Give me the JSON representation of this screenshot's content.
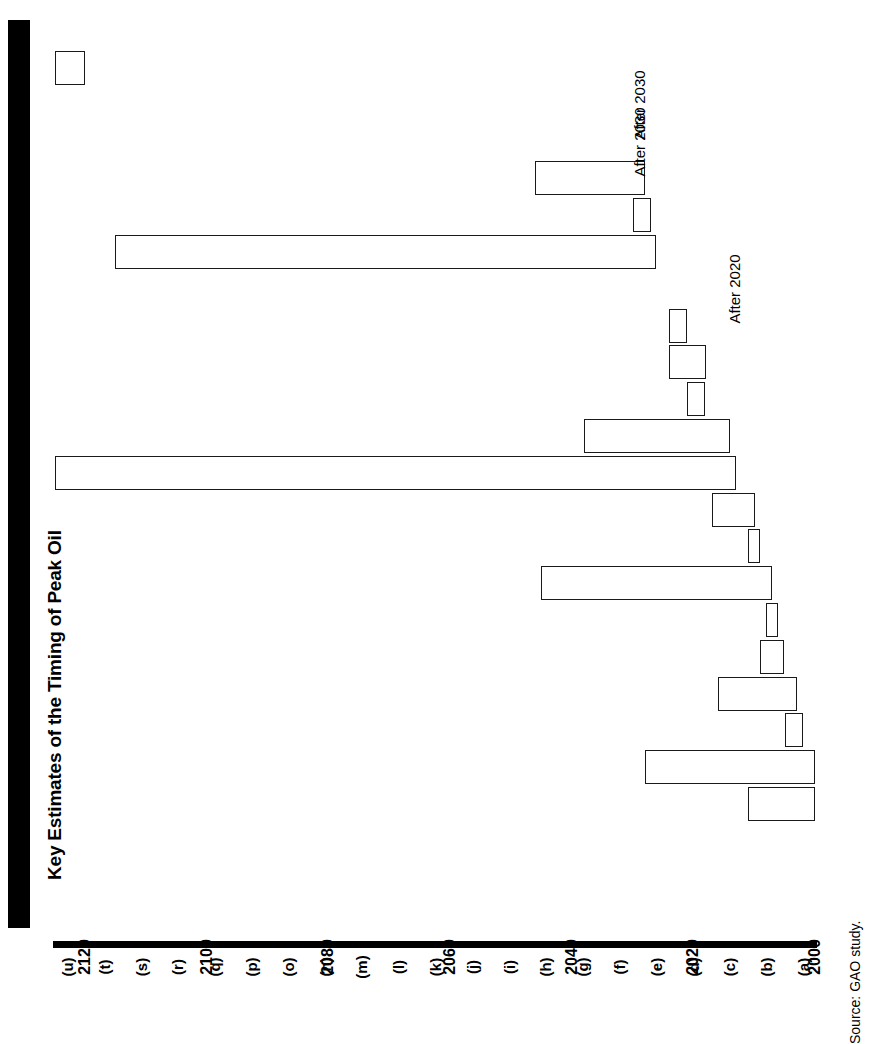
{
  "figure": {
    "title": "Key Estimates of the Timing of Peak Oil",
    "source": "Source: GAO study.",
    "orientation": "rotated-90"
  },
  "annotations": [
    {
      "text": "After 2030",
      "category": "(t)"
    },
    {
      "text": "After 2030",
      "category": "(s)"
    },
    {
      "text": "After 2020",
      "category": "(o)"
    }
  ],
  "annotation_labels": {
    "a1": "After 2030",
    "a2": "After 2030",
    "a3": "After 2020"
  },
  "axis": {
    "year_ticks": [
      "2000",
      "2020",
      "2040",
      "2060",
      "2080",
      "2100",
      "2120"
    ],
    "year_min": 2000,
    "year_max": 2125,
    "category_labels": [
      "(u)",
      "(t)",
      "(s)",
      "(r)",
      "(q)",
      "(p)",
      "(o)",
      "(n)",
      "(m)",
      "(l)",
      "(k)",
      "(j)",
      "(i)",
      "(h)",
      "(g)",
      "(f)",
      "(e)",
      "(d)",
      "(c)",
      "(b)",
      "(a)"
    ]
  },
  "ticks": {
    "t0": "2000",
    "t1": "2020",
    "t2": "2040",
    "t3": "2060",
    "t4": "2080",
    "t5": "2100",
    "t6": "2120"
  },
  "cats": {
    "c0": "(u)",
    "c1": "(t)",
    "c2": "(s)",
    "c3": "(r)",
    "c4": "(q)",
    "c5": "(p)",
    "c6": "(o)",
    "c7": "(n)",
    "c8": "(m)",
    "c9": "(l)",
    "c10": "(k)",
    "c11": "(j)",
    "c12": "(i)",
    "c13": "(h)",
    "c14": "(g)",
    "c15": "(f)",
    "c16": "(e)",
    "c17": "(d)",
    "c18": "(c)",
    "c19": "(b)",
    "c20": "(a)"
  },
  "colors": {
    "ink": "#000000",
    "bar_fill": "#ffffff",
    "bar_stroke": "#1a1a1a",
    "title_band": "#000000"
  },
  "chart_data": {
    "type": "bar",
    "title": "Key Estimates of the Timing of Peak Oil",
    "xlabel": "",
    "ylabel": "",
    "orientation": "horizontal-ranges",
    "note": "Each bar is a study's estimated range for the year of peak oil. Categories (a)-(u) are anonymized studies plotted bottom-to-top as (u)...(a).",
    "xlim": [
      2000,
      2125
    ],
    "grid": false,
    "legend": null,
    "categories": [
      "(u)",
      "(t)",
      "(s)",
      "(r)",
      "(q)",
      "(p)",
      "(o)",
      "(n)",
      "(m)",
      "(l)",
      "(k)",
      "(j)",
      "(i)",
      "(h)",
      "(g)",
      "(f)",
      "(e)",
      "(d)",
      "(c)",
      "(b)",
      "(a)"
    ],
    "ranges": [
      {
        "category": "(u)",
        "start": 2120,
        "end": 2125,
        "annotation": null
      },
      {
        "category": "(t)",
        "start": null,
        "end": null,
        "annotation": "After 2030"
      },
      {
        "category": "(s)",
        "start": null,
        "end": null,
        "annotation": "After 2030"
      },
      {
        "category": "(r)",
        "start": 2028,
        "end": 2046,
        "annotation": null
      },
      {
        "category": "(q)",
        "start": 2027,
        "end": 2030,
        "annotation": null
      },
      {
        "category": "(p)",
        "start": 2026,
        "end": 2115,
        "annotation": null
      },
      {
        "category": "(o)",
        "start": null,
        "end": null,
        "annotation": "After 2020"
      },
      {
        "category": "(n)",
        "start": 2021,
        "end": 2024,
        "annotation": null
      },
      {
        "category": "(m)",
        "start": 2018,
        "end": 2024,
        "annotation": null
      },
      {
        "category": "(l)",
        "start": 2018,
        "end": 2021,
        "annotation": null
      },
      {
        "category": "(k)",
        "start": 2014,
        "end": 2038,
        "annotation": null
      },
      {
        "category": "(j)",
        "start": 2013,
        "end": 2125,
        "annotation": null
      },
      {
        "category": "(i)",
        "start": 2010,
        "end": 2017,
        "annotation": null
      },
      {
        "category": "(h)",
        "start": 2009,
        "end": 2011,
        "annotation": null
      },
      {
        "category": "(g)",
        "start": 2007,
        "end": 2045,
        "annotation": null
      },
      {
        "category": "(f)",
        "start": 2006,
        "end": 2008,
        "annotation": null
      },
      {
        "category": "(e)",
        "start": 2005,
        "end": 2009,
        "annotation": null
      },
      {
        "category": "(d)",
        "start": 2003,
        "end": 2016,
        "annotation": null
      },
      {
        "category": "(c)",
        "start": 2002,
        "end": 2005,
        "annotation": null
      },
      {
        "category": "(b)",
        "start": 2000,
        "end": 2028,
        "annotation": null
      },
      {
        "category": "(a)",
        "start": 2000,
        "end": 2011,
        "annotation": null
      }
    ]
  }
}
